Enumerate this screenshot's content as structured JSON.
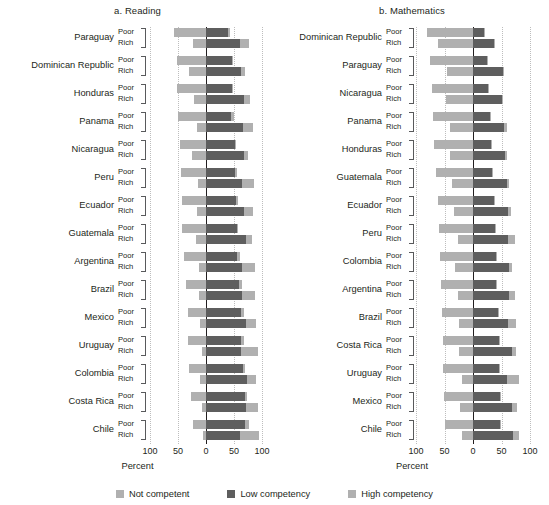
{
  "chart_data": {
    "type": "bar",
    "subtype": "diverging-stacked-bar",
    "xlabel": "Percent",
    "ylabel": "",
    "xlim": [
      -100,
      100
    ],
    "xticks": [
      100,
      50,
      0,
      50,
      100
    ],
    "grid": true,
    "legend_position": "bottom",
    "series": [
      {
        "name": "Not competent",
        "color": "#b0b0b0",
        "side": "left"
      },
      {
        "name": "Low competency",
        "color": "#5e5e5e",
        "side": "right"
      },
      {
        "name": "High competency",
        "color": "#b0b0b0",
        "side": "right-outer"
      }
    ],
    "panels": [
      {
        "id": "reading",
        "title": "a. Reading",
        "rows": [
          {
            "country": "Paraguay",
            "group": "Poor",
            "not_competent": 57,
            "low_competency": 39,
            "high_competency": 4
          },
          {
            "country": "Paraguay",
            "group": "Rich",
            "not_competent": 23,
            "low_competency": 61,
            "high_competency": 16
          },
          {
            "country": "Dominican Republic",
            "group": "Poor",
            "not_competent": 52,
            "low_competency": 46,
            "high_competency": 2
          },
          {
            "country": "Dominican Republic",
            "group": "Rich",
            "not_competent": 31,
            "low_competency": 62,
            "high_competency": 7
          },
          {
            "country": "Honduras",
            "group": "Poor",
            "not_competent": 51,
            "low_competency": 47,
            "high_competency": 2
          },
          {
            "country": "Honduras",
            "group": "Rich",
            "not_competent": 22,
            "low_competency": 67,
            "high_competency": 11
          },
          {
            "country": "Panama",
            "group": "Poor",
            "not_competent": 50,
            "low_competency": 44,
            "high_competency": 6
          },
          {
            "country": "Panama",
            "group": "Rich",
            "not_competent": 16,
            "low_competency": 66,
            "high_competency": 18
          },
          {
            "country": "Nicaragua",
            "group": "Poor",
            "not_competent": 47,
            "low_competency": 51,
            "high_competency": 2
          },
          {
            "country": "Nicaragua",
            "group": "Rich",
            "not_competent": 25,
            "low_competency": 68,
            "high_competency": 7
          },
          {
            "country": "Peru",
            "group": "Poor",
            "not_competent": 45,
            "low_competency": 51,
            "high_competency": 4
          },
          {
            "country": "Peru",
            "group": "Rich",
            "not_competent": 14,
            "low_competency": 65,
            "high_competency": 21
          },
          {
            "country": "Ecuador",
            "group": "Poor",
            "not_competent": 42,
            "low_competency": 54,
            "high_competency": 4
          },
          {
            "country": "Ecuador",
            "group": "Rich",
            "not_competent": 16,
            "low_competency": 68,
            "high_competency": 16
          },
          {
            "country": "Guatemala",
            "group": "Poor",
            "not_competent": 42,
            "low_competency": 56,
            "high_competency": 2
          },
          {
            "country": "Guatemala",
            "group": "Rich",
            "not_competent": 18,
            "low_competency": 72,
            "high_competency": 10
          },
          {
            "country": "Argentina",
            "group": "Poor",
            "not_competent": 40,
            "low_competency": 55,
            "high_competency": 5
          },
          {
            "country": "Argentina",
            "group": "Rich",
            "not_competent": 12,
            "low_competency": 65,
            "high_competency": 23
          },
          {
            "country": "Brazil",
            "group": "Poor",
            "not_competent": 36,
            "low_competency": 59,
            "high_competency": 5
          },
          {
            "country": "Brazil",
            "group": "Rich",
            "not_competent": 12,
            "low_competency": 65,
            "high_competency": 23
          },
          {
            "country": "Mexico",
            "group": "Poor",
            "not_competent": 33,
            "low_competency": 63,
            "high_competency": 4
          },
          {
            "country": "Mexico",
            "group": "Rich",
            "not_competent": 10,
            "low_competency": 71,
            "high_competency": 19
          },
          {
            "country": "Uruguay",
            "group": "Poor",
            "not_competent": 32,
            "low_competency": 62,
            "high_competency": 6
          },
          {
            "country": "Uruguay",
            "group": "Rich",
            "not_competent": 8,
            "low_competency": 62,
            "high_competency": 30
          },
          {
            "country": "Colombia",
            "group": "Poor",
            "not_competent": 30,
            "low_competency": 66,
            "high_competency": 4
          },
          {
            "country": "Colombia",
            "group": "Rich",
            "not_competent": 10,
            "low_competency": 74,
            "high_competency": 16
          },
          {
            "country": "Costa Rica",
            "group": "Poor",
            "not_competent": 26,
            "low_competency": 70,
            "high_competency": 4
          },
          {
            "country": "Costa Rica",
            "group": "Rich",
            "not_competent": 7,
            "low_competency": 72,
            "high_competency": 21
          },
          {
            "country": "Chile",
            "group": "Poor",
            "not_competent": 24,
            "low_competency": 69,
            "high_competency": 7
          },
          {
            "country": "Chile",
            "group": "Rich",
            "not_competent": 5,
            "low_competency": 60,
            "high_competency": 35
          }
        ]
      },
      {
        "id": "mathematics",
        "title": "b. Mathematics",
        "rows": [
          {
            "country": "Dominican Republic",
            "group": "Poor",
            "not_competent": 80,
            "low_competency": 19,
            "high_competency": 1
          },
          {
            "country": "Dominican Republic",
            "group": "Rich",
            "not_competent": 61,
            "low_competency": 37,
            "high_competency": 2
          },
          {
            "country": "Paraguay",
            "group": "Poor",
            "not_competent": 75,
            "low_competency": 24,
            "high_competency": 1
          },
          {
            "country": "Paraguay",
            "group": "Rich",
            "not_competent": 45,
            "low_competency": 52,
            "high_competency": 3
          },
          {
            "country": "Nicaragua",
            "group": "Poor",
            "not_competent": 72,
            "low_competency": 27,
            "high_competency": 1
          },
          {
            "country": "Nicaragua",
            "group": "Rich",
            "not_competent": 47,
            "low_competency": 51,
            "high_competency": 2
          },
          {
            "country": "Panama",
            "group": "Poor",
            "not_competent": 70,
            "low_competency": 29,
            "high_competency": 1
          },
          {
            "country": "Panama",
            "group": "Rich",
            "not_competent": 40,
            "low_competency": 55,
            "high_competency": 5
          },
          {
            "country": "Honduras",
            "group": "Poor",
            "not_competent": 68,
            "low_competency": 31,
            "high_competency": 1
          },
          {
            "country": "Honduras",
            "group": "Rich",
            "not_competent": 40,
            "low_competency": 57,
            "high_competency": 3
          },
          {
            "country": "Guatemala",
            "group": "Poor",
            "not_competent": 65,
            "low_competency": 34,
            "high_competency": 1
          },
          {
            "country": "Guatemala",
            "group": "Rich",
            "not_competent": 37,
            "low_competency": 60,
            "high_competency": 3
          },
          {
            "country": "Ecuador",
            "group": "Poor",
            "not_competent": 62,
            "low_competency": 37,
            "high_competency": 1
          },
          {
            "country": "Ecuador",
            "group": "Rich",
            "not_competent": 33,
            "low_competency": 62,
            "high_competency": 5
          },
          {
            "country": "Peru",
            "group": "Poor",
            "not_competent": 60,
            "low_competency": 38,
            "high_competency": 2
          },
          {
            "country": "Peru",
            "group": "Rich",
            "not_competent": 26,
            "low_competency": 62,
            "high_competency": 12
          },
          {
            "country": "Colombia",
            "group": "Poor",
            "not_competent": 58,
            "low_competency": 41,
            "high_competency": 1
          },
          {
            "country": "Colombia",
            "group": "Rich",
            "not_competent": 31,
            "low_competency": 64,
            "high_competency": 5
          },
          {
            "country": "Argentina",
            "group": "Poor",
            "not_competent": 57,
            "low_competency": 41,
            "high_competency": 2
          },
          {
            "country": "Argentina",
            "group": "Rich",
            "not_competent": 27,
            "low_competency": 63,
            "high_competency": 10
          },
          {
            "country": "Brazil",
            "group": "Poor",
            "not_competent": 55,
            "low_competency": 43,
            "high_competency": 2
          },
          {
            "country": "Brazil",
            "group": "Rich",
            "not_competent": 25,
            "low_competency": 62,
            "high_competency": 13
          },
          {
            "country": "Costa Rica",
            "group": "Poor",
            "not_competent": 53,
            "low_competency": 46,
            "high_competency": 1
          },
          {
            "country": "Costa Rica",
            "group": "Rich",
            "not_competent": 24,
            "low_competency": 68,
            "high_competency": 8
          },
          {
            "country": "Uruguay",
            "group": "Poor",
            "not_competent": 52,
            "low_competency": 45,
            "high_competency": 3
          },
          {
            "country": "Uruguay",
            "group": "Rich",
            "not_competent": 20,
            "low_competency": 60,
            "high_competency": 20
          },
          {
            "country": "Mexico",
            "group": "Poor",
            "not_competent": 51,
            "low_competency": 47,
            "high_competency": 2
          },
          {
            "country": "Mexico",
            "group": "Rich",
            "not_competent": 22,
            "low_competency": 69,
            "high_competency": 9
          },
          {
            "country": "Chile",
            "group": "Poor",
            "not_competent": 50,
            "low_competency": 48,
            "high_competency": 2
          },
          {
            "country": "Chile",
            "group": "Rich",
            "not_competent": 19,
            "low_competency": 70,
            "high_competency": 11
          }
        ]
      }
    ],
    "group_labels": {
      "poor": "Poor",
      "rich": "Rich"
    },
    "legend": [
      {
        "label": "Not competent",
        "color": "#b0b0b0"
      },
      {
        "label": "Low competency",
        "color": "#5e5e5e"
      },
      {
        "label": "High competency",
        "color": "#b0b0b0"
      }
    ]
  }
}
